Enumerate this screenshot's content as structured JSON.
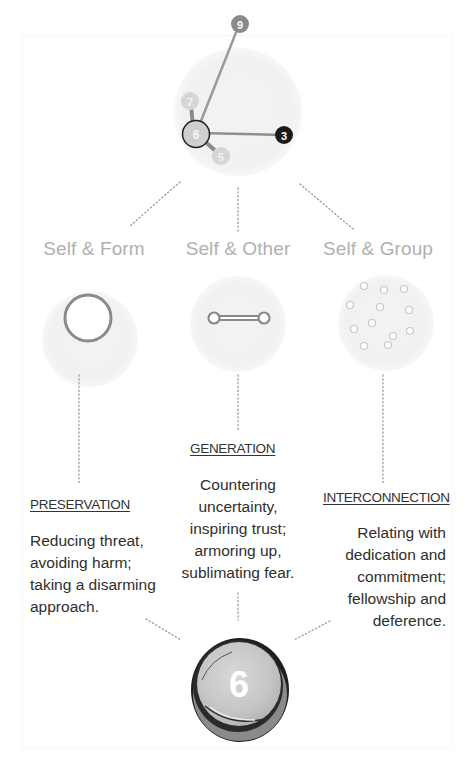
{
  "top_diagram": {
    "nodes": [
      {
        "label": "9",
        "color": "#8a8a8a"
      },
      {
        "label": "7",
        "color": "#d6d6d6"
      },
      {
        "label": "6",
        "color": "#cfcfcf"
      },
      {
        "label": "3",
        "color": "#1a1a1a"
      },
      {
        "label": "5",
        "color": "#d6d6d6"
      }
    ],
    "center_node": "6"
  },
  "categories": [
    {
      "label": "Self & Form",
      "icon": "ring-icon",
      "heading": "PRESERVATION",
      "description": [
        "Reducing threat,",
        "avoiding harm;",
        "taking a disarming",
        "approach."
      ]
    },
    {
      "label": "Self & Other",
      "icon": "dumbbell-link-icon",
      "heading": "GENERATION",
      "description": [
        "Countering",
        "uncertainty,",
        "inspiring trust;",
        "armoring up,",
        "sublimating fear."
      ]
    },
    {
      "label": "Self & Group",
      "icon": "scattered-dots-icon",
      "heading": "INTERCONNECTION",
      "description": [
        "Relating with",
        "dedication and",
        "commitment;",
        "fellowship and",
        "deference."
      ]
    }
  ],
  "bottom_badge": {
    "label": "6"
  },
  "colors": {
    "label_gray": "#b0b0b0",
    "text_dark": "#2e2e2e",
    "badge_fill": "#c9c9c9",
    "badge_rim": "#1e1e1e"
  }
}
